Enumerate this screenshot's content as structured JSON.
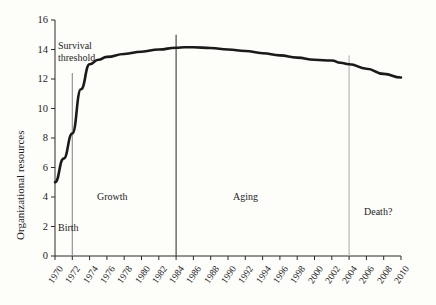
{
  "chart_data": {
    "type": "line",
    "title": "",
    "subtitle": "",
    "xlabel": "",
    "ylabel": "Organizational resources",
    "xlim": [
      1970,
      2010
    ],
    "ylim": [
      0,
      16
    ],
    "ytick_step": 2,
    "xtick_step": 2,
    "grid": false,
    "legend": "none",
    "ytick_labels": [
      "0",
      "2",
      "4",
      "6",
      "8",
      "10",
      "12",
      "14",
      "16"
    ],
    "ytick_values": [
      0,
      2,
      4,
      6,
      8,
      10,
      12,
      14,
      16
    ],
    "xtick_labels": [
      "1970",
      "1972",
      "1974",
      "1976",
      "1978",
      "1980",
      "1982",
      "1984",
      "1986",
      "1988",
      "1990",
      "1992",
      "1994",
      "1996",
      "1998",
      "2000",
      "2002",
      "2004",
      "2006",
      "2008",
      "2010"
    ],
    "xtick_values": [
      1970,
      1972,
      1974,
      1976,
      1978,
      1980,
      1982,
      1984,
      1986,
      1988,
      1990,
      1992,
      1994,
      1996,
      1998,
      2000,
      2002,
      2004,
      2006,
      2008,
      2010
    ],
    "series": [
      {
        "name": "Organizational resources",
        "color": "#1a1a1a",
        "x": [
          1970,
          1971,
          1972,
          1973,
          1974,
          1975,
          1976,
          1978,
          1980,
          1982,
          1984,
          1985,
          1986,
          1988,
          1990,
          1992,
          1994,
          1996,
          1998,
          2000,
          2002,
          2003,
          2004,
          2006,
          2008,
          2010
        ],
        "values": [
          5.0,
          6.6,
          8.3,
          11.3,
          13.0,
          13.3,
          13.5,
          13.7,
          13.85,
          14.0,
          14.12,
          14.15,
          14.15,
          14.1,
          14.0,
          13.9,
          13.75,
          13.6,
          13.45,
          13.3,
          13.25,
          13.1,
          13.0,
          12.7,
          12.35,
          12.1
        ]
      }
    ],
    "vertical_markers": [
      {
        "name": "survival-threshold",
        "x": 1972,
        "color": "#8a8a8a",
        "y_top": 12.4,
        "label": "Survival\nthreshold"
      },
      {
        "name": "growth-aging-divider",
        "x": 1984,
        "color": "#3a3a3a",
        "y_top": 15.0,
        "label": ""
      },
      {
        "name": "aging-death-divider",
        "x": 2004,
        "color": "#b0b0b0",
        "y_top": 13.6,
        "label": ""
      }
    ],
    "annotations": [
      {
        "name": "survival-threshold-note",
        "line1": "Survival",
        "line2": "threshold"
      },
      {
        "name": "phase-birth",
        "text": "Birth"
      },
      {
        "name": "phase-growth",
        "text": "Growth"
      },
      {
        "name": "phase-aging",
        "text": "Aging"
      },
      {
        "name": "phase-death",
        "text": "Death?"
      }
    ]
  }
}
